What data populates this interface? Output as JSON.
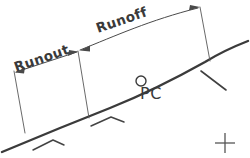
{
  "diagram": {
    "background_color": "#ffffff",
    "ink_color": "#3b3b3b",
    "width": 250,
    "height": 158,
    "labels": {
      "runout": "Runout",
      "runoff": "Runoff",
      "pc": "PC"
    },
    "annotations": [
      {
        "name": "runout-dimension",
        "label": "Runout",
        "description": "Double-arrow dimension spanning the tangent runout segment on the left",
        "arrow_style": "double-headed"
      },
      {
        "name": "runoff-dimension",
        "label": "Runoff",
        "description": "Double-arrow dimension spanning the superelevation runoff segment on the right",
        "arrow_style": "double-headed"
      },
      {
        "name": "pc-point",
        "label": "PC",
        "description": "Point of Curvature marked with a small open circle on the alignment"
      }
    ],
    "graphics": {
      "road_alignment": "Tangent on the left transitioning into a horizontal curve rising to the right",
      "hatch_marks": 2,
      "tick_marks": 1,
      "registration_cross": "small crosshair at lower right"
    }
  }
}
